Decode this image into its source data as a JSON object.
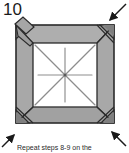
{
  "step": {
    "number": "10",
    "caption": "Repeat steps 8-9 on the"
  },
  "colors": {
    "band_fill": "#a8a8a8",
    "band_fill_light": "#b9b9b9",
    "band_fill_dark": "#969696",
    "flap_fill": "#9d9d9d",
    "paper_white": "#ffffff",
    "outline": "#2b2b2b",
    "crease": "#8d8d8d",
    "arrow": "#1a1a1a",
    "number_color": "#1b1b1b"
  },
  "figure": {
    "outer_square": {
      "x": 16,
      "y": 25,
      "w": 98,
      "h": 98
    },
    "inner_square": {
      "x": 33,
      "y": 43,
      "w": 64,
      "h": 64
    },
    "corner_flaps": [
      {
        "name": "top-left-flap",
        "corner": "top-left"
      },
      {
        "name": "top-right-flap",
        "corner": "top-right"
      },
      {
        "name": "bottom-left-flap",
        "corner": "bottom-left"
      },
      {
        "name": "bottom-right-flap",
        "corner": "bottom-right"
      }
    ],
    "crease_lines": {
      "count": 8,
      "kinds": [
        "diagonal-nw-se",
        "diagonal-ne-sw",
        "horizontal",
        "vertical"
      ]
    },
    "arrows": [
      {
        "name": "arrow-top-right",
        "direction": "down-left",
        "points_inward": true
      },
      {
        "name": "arrow-bottom-right",
        "direction": "up-left",
        "points_inward": true
      },
      {
        "name": "arrow-bottom-left",
        "direction": "up-right",
        "points_inward": true
      },
      {
        "name": "arrow-top-left",
        "direction": "down-right",
        "points_inward": true
      }
    ]
  }
}
